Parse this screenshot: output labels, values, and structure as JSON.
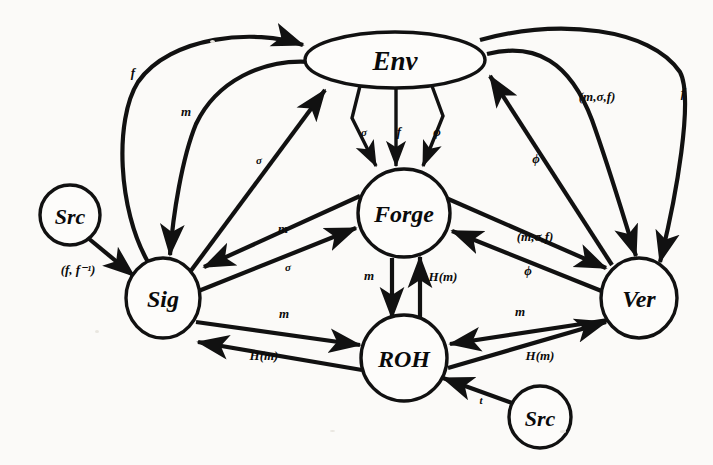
{
  "diagram": {
    "background_color": "#fbfaf8",
    "ink_color": "#111111",
    "nodes": [
      {
        "id": "env",
        "label": "Env",
        "shape": "ellipse",
        "cx": 395,
        "cy": 60,
        "rx": 90,
        "ry": 28
      },
      {
        "id": "forge",
        "label": "Forge",
        "shape": "ellipse",
        "cx": 404,
        "cy": 213,
        "rx": 46,
        "ry": 44
      },
      {
        "id": "sig",
        "label": "Sig",
        "shape": "circle",
        "cx": 163,
        "cy": 298,
        "rx": 37,
        "ry": 40
      },
      {
        "id": "ver",
        "label": "Ver",
        "shape": "ellipse",
        "cx": 639,
        "cy": 298,
        "rx": 38,
        "ry": 40
      },
      {
        "id": "roh",
        "label": "ROH",
        "shape": "ellipse",
        "cx": 404,
        "cy": 358,
        "rx": 43,
        "ry": 43
      },
      {
        "id": "src1",
        "label": "Src",
        "shape": "circle",
        "cx": 70,
        "cy": 215,
        "rx": 30,
        "ry": 30
      },
      {
        "id": "src2",
        "label": "Src",
        "shape": "circle",
        "cx": 540,
        "cy": 417,
        "rx": 31,
        "ry": 31
      }
    ],
    "edges": [
      {
        "id": "sig-env-f",
        "from": "sig",
        "to": "env",
        "label": "f",
        "label_x": 133,
        "label_y": 72
      },
      {
        "id": "env-sig-m",
        "from": "env",
        "to": "sig",
        "label": "m",
        "label_x": 186,
        "label_y": 111
      },
      {
        "id": "sig-env-sigma",
        "from": "sig",
        "to": "env",
        "label": "σ",
        "label_x": 259,
        "label_y": 160
      },
      {
        "id": "env-forge-sigma",
        "from": "env",
        "to": "forge",
        "label": "σ",
        "label_x": 364,
        "label_y": 132
      },
      {
        "id": "env-forge-f",
        "from": "env",
        "to": "forge",
        "label": "f",
        "label_x": 399,
        "label_y": 131
      },
      {
        "id": "env-forge-phi",
        "from": "env",
        "to": "forge",
        "label": "ϕ",
        "label_x": 437,
        "label_y": 131
      },
      {
        "id": "ver-env-phi",
        "from": "ver",
        "to": "env",
        "label": "ϕ",
        "label_x": 536,
        "label_y": 158
      },
      {
        "id": "env-ver-msf",
        "from": "env",
        "to": "ver",
        "label": "(m,σ,f)",
        "label_x": 597,
        "label_y": 96
      },
      {
        "id": "env-ver-f",
        "from": "env",
        "to": "ver",
        "label": "f",
        "label_x": 683,
        "label_y": 92
      },
      {
        "id": "forge-sig-m",
        "from": "forge",
        "to": "sig",
        "label": "m",
        "label_x": 283,
        "label_y": 228
      },
      {
        "id": "sig-forge-sigma",
        "from": "sig",
        "to": "forge",
        "label": "σ",
        "label_x": 288,
        "label_y": 267
      },
      {
        "id": "forge-ver-msf",
        "from": "forge",
        "to": "ver",
        "label": "(m,σ,f)",
        "label_x": 535,
        "label_y": 236
      },
      {
        "id": "ver-forge-phi",
        "from": "ver",
        "to": "forge",
        "label": "ϕ",
        "label_x": 528,
        "label_y": 270
      },
      {
        "id": "forge-roh-m",
        "from": "forge",
        "to": "roh",
        "label": "m",
        "label_x": 369,
        "label_y": 275
      },
      {
        "id": "roh-forge-hm",
        "from": "roh",
        "to": "forge",
        "label": "H(m)",
        "label_x": 443,
        "label_y": 276
      },
      {
        "id": "sig-roh-m",
        "from": "sig",
        "to": "roh",
        "label": "m",
        "label_x": 284,
        "label_y": 313
      },
      {
        "id": "roh-sig-hm",
        "from": "roh",
        "to": "sig",
        "label": "H(m)",
        "label_x": 264,
        "label_y": 355
      },
      {
        "id": "ver-roh-m",
        "from": "ver",
        "to": "roh",
        "label": "m",
        "label_x": 520,
        "label_y": 311
      },
      {
        "id": "roh-ver-hm",
        "from": "roh",
        "to": "ver",
        "label": "H(m)",
        "label_x": 540,
        "label_y": 355
      },
      {
        "id": "src1-sig-ff",
        "from": "src1",
        "to": "sig",
        "label": "(f, f⁻¹)",
        "label_x": 78,
        "label_y": 269
      },
      {
        "id": "src2-roh-t",
        "from": "src2",
        "to": "roh",
        "label": "t",
        "label_x": 481,
        "label_y": 400
      }
    ]
  }
}
